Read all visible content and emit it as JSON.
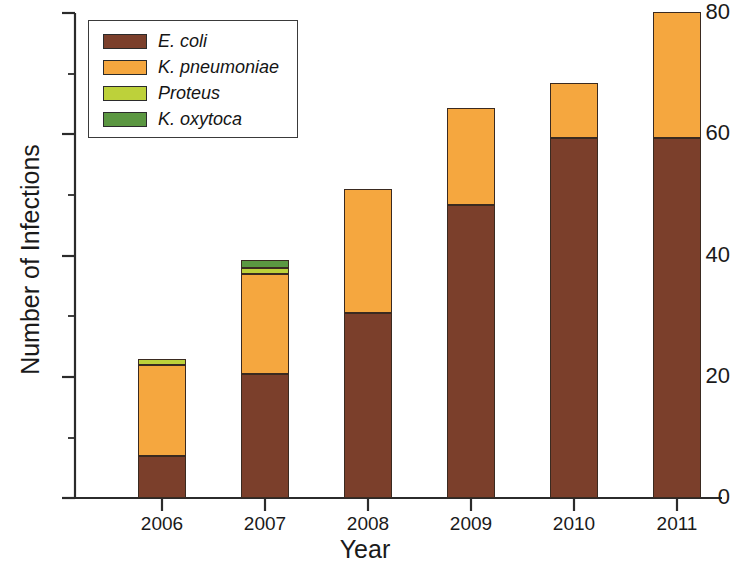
{
  "chart_data": {
    "type": "bar",
    "stacked": true,
    "title": "",
    "xlabel": "Year",
    "ylabel": "Number of Infections",
    "categories": [
      "2006",
      "2007",
      "2008",
      "2009",
      "2010",
      "2011"
    ],
    "ylim": [
      0,
      80
    ],
    "yticks": [
      0,
      20,
      40,
      60,
      80
    ],
    "yminorticks": [
      10,
      30,
      50,
      70
    ],
    "grid": false,
    "legend_position": "top-left",
    "series": [
      {
        "name": "E. coli",
        "color": "#7b3f2b",
        "values": [
          7,
          20.5,
          30.5,
          48.3,
          59.3,
          59.3
        ]
      },
      {
        "name": "K. pneumoniae",
        "color": "#f5a73f",
        "values": [
          15,
          16.5,
          20.5,
          16.1,
          9.2,
          20.8
        ]
      },
      {
        "name": "Proteus",
        "color": "#bdd13a",
        "values": [
          1,
          1,
          0,
          0,
          0,
          0
        ]
      },
      {
        "name": "K. oxytoca",
        "color": "#5b9741",
        "values": [
          0,
          1.3,
          0,
          0,
          0,
          0
        ]
      }
    ],
    "totals": [
      23,
      39.3,
      51,
      64.4,
      68.5,
      80.1
    ]
  },
  "axis": {
    "y_title": "Number of Infections",
    "x_title": "Year",
    "y_tick_labels": [
      "80",
      "60",
      "40",
      "20",
      "0"
    ],
    "x_tick_labels": [
      "2006",
      "2007",
      "2008",
      "2009",
      "2010",
      "2011"
    ]
  },
  "legend": {
    "items": [
      {
        "label": "E. coli",
        "color": "#7b3f2b"
      },
      {
        "label": "K. pneumoniae",
        "color": "#f5a73f"
      },
      {
        "label": "Proteus",
        "color": "#bdd13a"
      },
      {
        "label": "K. oxytoca",
        "color": "#5b9741"
      }
    ]
  },
  "colors": {
    "ecoli": "#7b3f2b",
    "kpneumoniae": "#f5a73f",
    "proteus": "#bdd13a",
    "koxytoca": "#5b9741",
    "axis": "#2b2b2b",
    "background": "#ffffff"
  }
}
